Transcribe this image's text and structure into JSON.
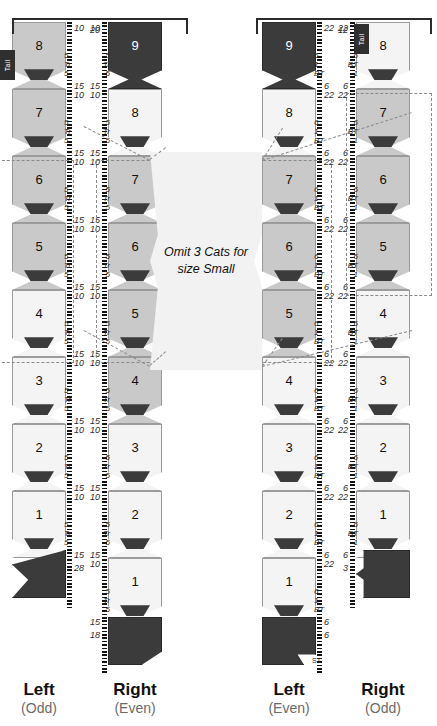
{
  "diagram": {
    "callout": {
      "line1": "Omit 3 Cats for",
      "line2": "size Small"
    },
    "labels": {
      "tail": "Tail",
      "tr": "Tr",
      "bt": "BT",
      "st": "ST"
    }
  },
  "columns": [
    {
      "id": "col-1",
      "footer_main": "Left",
      "footer_sub": "(Odd)",
      "ruler_side": "right",
      "has_tail_tab": true,
      "top_cat": 8,
      "end_count": "28",
      "top_count": null,
      "cats": [
        {
          "n": "8",
          "shade": "gray"
        },
        {
          "n": "7",
          "shade": "gray"
        },
        {
          "n": "6",
          "shade": "gray"
        },
        {
          "n": "5",
          "shade": "gray"
        },
        {
          "n": "4",
          "shade": "light"
        },
        {
          "n": "3",
          "shade": "light"
        },
        {
          "n": "2",
          "shade": "light"
        },
        {
          "n": "1",
          "shade": "light"
        }
      ],
      "tick_groups": [
        "10",
        "5",
        "Tr",
        "5",
        "15"
      ],
      "highlight": {
        "from": 2,
        "to": 4
      }
    },
    {
      "id": "col-2",
      "footer_main": "Right",
      "footer_sub": "(Even)",
      "ruler_side": "left",
      "has_tail_tab": false,
      "top_cat": 9,
      "end_count": "18",
      "top_count": "20",
      "cats": [
        {
          "n": "9",
          "shade": "dark"
        },
        {
          "n": "8",
          "shade": "light"
        },
        {
          "n": "7",
          "shade": "gray"
        },
        {
          "n": "6",
          "shade": "gray"
        },
        {
          "n": "5",
          "shade": "gray"
        },
        {
          "n": "4",
          "shade": "gray"
        },
        {
          "n": "3",
          "shade": "light"
        },
        {
          "n": "2",
          "shade": "light"
        },
        {
          "n": "1",
          "shade": "light"
        }
      ],
      "tick_groups": [
        "10",
        "5",
        "Tr",
        "5",
        "15"
      ],
      "highlight": {
        "from": 2,
        "to": 4
      }
    },
    {
      "id": "col-3",
      "footer_main": "Left",
      "footer_sub": "(Even)",
      "ruler_side": "right",
      "has_tail_tab": false,
      "top_cat": 9,
      "end_count": "6",
      "end_label": "ST",
      "top_count": null,
      "cats": [
        {
          "n": "9",
          "shade": "dark"
        },
        {
          "n": "8",
          "shade": "light"
        },
        {
          "n": "7",
          "shade": "gray"
        },
        {
          "n": "6",
          "shade": "gray"
        },
        {
          "n": "5",
          "shade": "gray"
        },
        {
          "n": "4",
          "shade": "light"
        },
        {
          "n": "3",
          "shade": "light"
        },
        {
          "n": "2",
          "shade": "light"
        },
        {
          "n": "1",
          "shade": "light"
        }
      ],
      "tick_groups": [
        "22",
        "6",
        "1",
        "BT",
        "6"
      ],
      "highlight": {
        "from": 2,
        "to": 4
      }
    },
    {
      "id": "col-4",
      "footer_main": "Right",
      "footer_sub": "(Odd)",
      "ruler_side": "left",
      "has_tail_tab": true,
      "top_cat": 8,
      "end_count": "3",
      "top_count": "12",
      "cats": [
        {
          "n": "8",
          "shade": "light"
        },
        {
          "n": "7",
          "shade": "gray"
        },
        {
          "n": "6",
          "shade": "gray"
        },
        {
          "n": "5",
          "shade": "gray"
        },
        {
          "n": "4",
          "shade": "light"
        },
        {
          "n": "3",
          "shade": "light"
        },
        {
          "n": "2",
          "shade": "light"
        },
        {
          "n": "1",
          "shade": "light"
        }
      ],
      "tick_groups": [
        "22",
        "6",
        "BT",
        "1",
        "6"
      ],
      "highlight": {
        "from": 1,
        "to": 3
      }
    }
  ]
}
